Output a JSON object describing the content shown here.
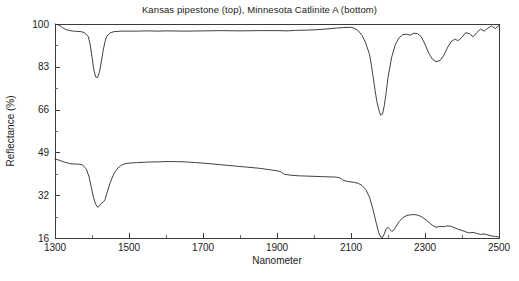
{
  "chart_data": {
    "type": "line",
    "title": "Kansas pipestone (top), Minnesota Catlinite A (bottom)",
    "xlabel": "Nanometer",
    "ylabel": "Reflectance (%)",
    "xlim": [
      1300,
      2500
    ],
    "ylim": [
      16,
      100
    ],
    "xticks": [
      1300,
      1500,
      1700,
      1900,
      2100,
      2300,
      2500
    ],
    "xtick_labels": [
      "1300",
      "1500",
      "1700",
      "1900",
      "2100",
      "2300",
      "2500"
    ],
    "xminor_step": 100,
    "yticks": [
      16,
      32,
      49,
      66,
      83,
      100
    ],
    "ytick_labels": [
      "16",
      "32",
      "49",
      "66",
      "83",
      "100"
    ],
    "grid": false,
    "legend": "none",
    "series": [
      {
        "name": "Kansas pipestone (top)",
        "color": "#2b2b2b",
        "x": [
          1300,
          1310,
          1320,
          1330,
          1340,
          1350,
          1360,
          1370,
          1380,
          1390,
          1395,
          1400,
          1405,
          1410,
          1415,
          1420,
          1425,
          1430,
          1435,
          1440,
          1450,
          1460,
          1470,
          1480,
          1500,
          1520,
          1550,
          1580,
          1600,
          1650,
          1700,
          1750,
          1800,
          1850,
          1900,
          1930,
          1950,
          1980,
          2000,
          2030,
          2060,
          2080,
          2100,
          2110,
          2120,
          2130,
          2140,
          2150,
          2155,
          2160,
          2165,
          2170,
          2175,
          2180,
          2185,
          2190,
          2195,
          2200,
          2210,
          2220,
          2230,
          2240,
          2250,
          2260,
          2270,
          2280,
          2290,
          2300,
          2310,
          2320,
          2330,
          2340,
          2350,
          2360,
          2370,
          2380,
          2390,
          2400,
          2410,
          2420,
          2430,
          2440,
          2450,
          2460,
          2470,
          2480,
          2490,
          2500
        ],
        "y": [
          100.0,
          99.6,
          98.6,
          97.8,
          97.4,
          97.2,
          97.1,
          97.0,
          96.6,
          95.0,
          92.0,
          87.0,
          82.0,
          79.2,
          79.0,
          81.0,
          85.0,
          89.5,
          93.0,
          95.2,
          96.6,
          97.0,
          97.1,
          97.2,
          97.2,
          97.2,
          97.3,
          97.2,
          97.3,
          97.2,
          97.3,
          97.4,
          97.3,
          97.4,
          97.4,
          97.3,
          97.5,
          97.6,
          97.7,
          98.0,
          98.4,
          98.6,
          98.7,
          98.3,
          97.3,
          95.5,
          92.5,
          88.0,
          84.0,
          79.0,
          74.0,
          69.5,
          66.5,
          64.2,
          64.6,
          68.0,
          73.0,
          79.0,
          87.0,
          92.0,
          94.6,
          95.8,
          96.0,
          95.6,
          96.4,
          96.2,
          95.0,
          92.0,
          88.6,
          86.2,
          85.2,
          85.6,
          87.5,
          90.5,
          93.0,
          94.0,
          93.5,
          94.8,
          96.6,
          96.2,
          95.0,
          96.6,
          98.0,
          97.2,
          98.4,
          99.2,
          98.2,
          99.5
        ]
      },
      {
        "name": "Minnesota Catlinite A (bottom)",
        "color": "#2b2b2b",
        "x": [
          1300,
          1310,
          1325,
          1340,
          1355,
          1365,
          1375,
          1385,
          1392,
          1398,
          1404,
          1410,
          1416,
          1420,
          1425,
          1430,
          1435,
          1440,
          1450,
          1460,
          1470,
          1480,
          1490,
          1500,
          1520,
          1550,
          1580,
          1600,
          1620,
          1650,
          1680,
          1700,
          1730,
          1760,
          1790,
          1820,
          1850,
          1880,
          1900,
          1910,
          1920,
          1940,
          1960,
          1980,
          2000,
          2020,
          2040,
          2060,
          2070,
          2080,
          2090,
          2100,
          2110,
          2120,
          2130,
          2140,
          2150,
          2160,
          2168,
          2175,
          2180,
          2185,
          2190,
          2195,
          2200,
          2205,
          2210,
          2215,
          2220,
          2230,
          2240,
          2250,
          2260,
          2270,
          2280,
          2290,
          2300,
          2310,
          2320,
          2330,
          2340,
          2350,
          2360,
          2370,
          2380,
          2390,
          2400,
          2410,
          2420,
          2430,
          2440,
          2450,
          2460,
          2470,
          2480,
          2490,
          2500
        ],
        "y": [
          47.0,
          46.6,
          45.8,
          45.2,
          45.0,
          45.0,
          44.6,
          43.0,
          40.0,
          36.0,
          32.0,
          29.2,
          28.0,
          28.6,
          29.6,
          30.0,
          31.0,
          33.5,
          38.0,
          41.5,
          43.5,
          44.6,
          45.2,
          45.4,
          45.6,
          45.8,
          45.9,
          46.0,
          46.0,
          45.9,
          45.6,
          45.4,
          45.0,
          44.6,
          44.2,
          43.8,
          43.4,
          42.8,
          42.4,
          42.0,
          41.0,
          40.6,
          40.4,
          40.3,
          40.2,
          40.1,
          40.0,
          39.9,
          39.6,
          38.6,
          38.2,
          38.0,
          37.8,
          37.4,
          36.6,
          35.0,
          32.0,
          27.0,
          22.0,
          18.0,
          16.4,
          16.2,
          17.6,
          19.6,
          20.2,
          19.4,
          18.6,
          19.0,
          20.2,
          22.4,
          24.0,
          24.8,
          25.1,
          25.2,
          25.0,
          24.4,
          23.4,
          22.2,
          21.0,
          20.2,
          20.6,
          20.4,
          20.8,
          20.6,
          20.0,
          19.4,
          19.0,
          18.4,
          18.0,
          18.2,
          17.8,
          17.4,
          17.6,
          17.2,
          16.8,
          16.6,
          16.4
        ]
      }
    ]
  },
  "plot_geometry": {
    "left": 55,
    "right": 499,
    "top": 24,
    "bottom": 238
  }
}
